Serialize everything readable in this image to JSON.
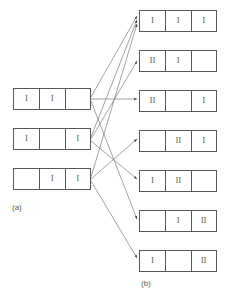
{
  "figure": {
    "background_color": "#ffffff",
    "stroke_color": "#595959",
    "edge_color": "#7a7a7a",
    "text_color": "#444444",
    "label_color": "#5a5a5a",
    "width": 227,
    "height": 302
  },
  "panel_a": {
    "label": "(a)",
    "label_x": 12,
    "label_y": 203,
    "origin_x": 13,
    "origin_y": 88,
    "row_width": 78,
    "row_height": 22,
    "row_gap": 18,
    "cell_widths": [
      26,
      26,
      26
    ],
    "rows": [
      {
        "name": "a-row-1",
        "cells": [
          "I",
          "I",
          ""
        ]
      },
      {
        "name": "a-row-2",
        "cells": [
          "I",
          "",
          "I"
        ]
      },
      {
        "name": "a-row-3",
        "cells": [
          "",
          "I",
          "I"
        ]
      }
    ]
  },
  "panel_b": {
    "label": "(b)",
    "label_x": 141,
    "label_y": 279,
    "origin_x": 139,
    "origin_y": 10,
    "row_width": 78,
    "row_height": 22,
    "row_gap": 18,
    "cell_widths": [
      26,
      26,
      26
    ],
    "rows": [
      {
        "name": "b-row-1",
        "cells": [
          "I",
          "I",
          "I"
        ]
      },
      {
        "name": "b-row-2",
        "cells": [
          "II",
          "I",
          ""
        ]
      },
      {
        "name": "b-row-3",
        "cells": [
          "II",
          "",
          "I"
        ]
      },
      {
        "name": "b-row-4",
        "cells": [
          "",
          "II",
          "I"
        ]
      },
      {
        "name": "b-row-5",
        "cells": [
          "I",
          "II",
          ""
        ]
      },
      {
        "name": "b-row-6",
        "cells": [
          "",
          "I",
          "II"
        ]
      },
      {
        "name": "b-row-7",
        "cells": [
          "I",
          "",
          "II"
        ]
      }
    ]
  },
  "edges": [
    {
      "name": "edge-a1-b1",
      "from": "a-row-1",
      "to": "b-row-1",
      "x1": 91,
      "y1": 97,
      "x2": 137,
      "y2": 16
    },
    {
      "name": "edge-a1-b3",
      "from": "a-row-1",
      "to": "b-row-3",
      "x1": 91,
      "y1": 99,
      "x2": 137,
      "y2": 99
    },
    {
      "name": "edge-a1-b6",
      "from": "a-row-1",
      "to": "b-row-6",
      "x1": 91,
      "y1": 101,
      "x2": 137,
      "y2": 219
    },
    {
      "name": "edge-a2-b1",
      "from": "a-row-2",
      "to": "b-row-1",
      "x1": 91,
      "y1": 137,
      "x2": 137,
      "y2": 20
    },
    {
      "name": "edge-a2-b2",
      "from": "a-row-2",
      "to": "b-row-2",
      "x1": 91,
      "y1": 139,
      "x2": 137,
      "y2": 61
    },
    {
      "name": "edge-a2-b5",
      "from": "a-row-2",
      "to": "b-row-5",
      "x1": 91,
      "y1": 141,
      "x2": 137,
      "y2": 179
    },
    {
      "name": "edge-a3-b1",
      "from": "a-row-3",
      "to": "b-row-1",
      "x1": 91,
      "y1": 177,
      "x2": 137,
      "y2": 24
    },
    {
      "name": "edge-a3-b4",
      "from": "a-row-3",
      "to": "b-row-4",
      "x1": 91,
      "y1": 179,
      "x2": 137,
      "y2": 139
    },
    {
      "name": "edge-a3-b7",
      "from": "a-row-3",
      "to": "b-row-7",
      "x1": 91,
      "y1": 181,
      "x2": 137,
      "y2": 258
    }
  ]
}
